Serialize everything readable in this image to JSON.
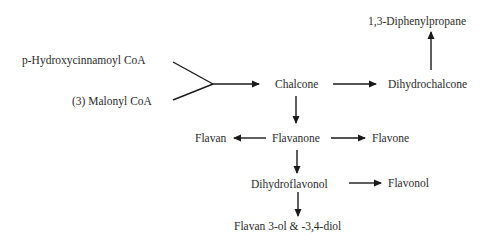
{
  "diagram": {
    "type": "flowchart",
    "title": "",
    "colors": {
      "text": "#2a2a2a",
      "line": "#1a1a1a",
      "background": "#ffffff"
    },
    "nodes": {
      "p_hydroxycinnamoyl_coa": "p-Hydroxycinnamoyl CoA",
      "malonyl_coa": "(3) Malonyl CoA",
      "chalcone": "Chalcone",
      "dihydrochalcone": "Dihydrochalcone",
      "diphenylpropane": "1,3-Diphenylpropane",
      "flavan": "Flavan",
      "flavanone": "Flavanone",
      "flavone": "Flavone",
      "dihydroflavonol": "Dihydroflavonol",
      "flavonol": "Flavonol",
      "flavan_diol": "Flavan 3-ol & -3,4-diol"
    },
    "edges": [
      {
        "from": "p_hydroxycinnamoyl_coa + malonyl_coa",
        "to": "chalcone"
      },
      {
        "from": "chalcone",
        "to": "dihydrochalcone"
      },
      {
        "from": "dihydrochalcone",
        "to": "diphenylpropane"
      },
      {
        "from": "chalcone",
        "to": "flavanone"
      },
      {
        "from": "flavanone",
        "to": "flavan"
      },
      {
        "from": "flavanone",
        "to": "flavone"
      },
      {
        "from": "flavanone",
        "to": "dihydroflavonol"
      },
      {
        "from": "dihydroflavonol",
        "to": "flavonol"
      },
      {
        "from": "dihydroflavonol",
        "to": "flavan_diol"
      }
    ]
  }
}
